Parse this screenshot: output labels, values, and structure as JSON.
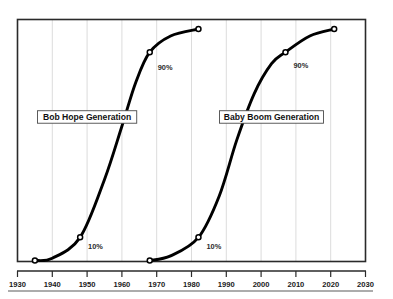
{
  "chart_data": {
    "type": "line",
    "title": "",
    "subtitle": "",
    "xlabel": "",
    "ylabel": "",
    "xlim": [
      1930,
      2030
    ],
    "ylim": [
      0,
      100
    ],
    "xticks": [
      1930,
      1940,
      1950,
      1960,
      1970,
      1980,
      1990,
      2000,
      2010,
      2020,
      2030
    ],
    "xtick_labels": [
      "1930",
      "1940",
      "1950",
      "1960",
      "1970",
      "1980",
      "1990",
      "2000",
      "2010",
      "2020",
      "2030"
    ],
    "yticks": [],
    "ytick_labels": [],
    "grid": "vertical",
    "legend": "inline-boxed-annotations",
    "series": [
      {
        "name": "Bob Hope Generation",
        "points": [
          {
            "x": 1935,
            "y": 0
          },
          {
            "x": 1940,
            "y": 1
          },
          {
            "x": 1948,
            "y": 10
          },
          {
            "x": 1955,
            "y": 35
          },
          {
            "x": 1960,
            "y": 58
          },
          {
            "x": 1964,
            "y": 77
          },
          {
            "x": 1968,
            "y": 90
          },
          {
            "x": 1974,
            "y": 97
          },
          {
            "x": 1982,
            "y": 100
          }
        ],
        "markers": [
          {
            "x": 1935,
            "y": 0,
            "label": ""
          },
          {
            "x": 1948,
            "y": 10,
            "label": "10%"
          },
          {
            "x": 1968,
            "y": 90,
            "label": "90%"
          },
          {
            "x": 1982,
            "y": 100,
            "label": ""
          }
        ]
      },
      {
        "name": "Baby Boom Generation",
        "points": [
          {
            "x": 1968,
            "y": 0
          },
          {
            "x": 1974,
            "y": 2
          },
          {
            "x": 1982,
            "y": 10
          },
          {
            "x": 1988,
            "y": 28
          },
          {
            "x": 1993,
            "y": 52
          },
          {
            "x": 1998,
            "y": 72
          },
          {
            "x": 2003,
            "y": 85
          },
          {
            "x": 2007,
            "y": 90
          },
          {
            "x": 2014,
            "y": 97
          },
          {
            "x": 2021,
            "y": 100
          }
        ],
        "markers": [
          {
            "x": 1968,
            "y": 0,
            "label": ""
          },
          {
            "x": 1982,
            "y": 10,
            "label": "10%"
          },
          {
            "x": 2007,
            "y": 90,
            "label": "90%"
          },
          {
            "x": 2021,
            "y": 100,
            "label": ""
          }
        ]
      }
    ],
    "annotations": [
      {
        "text": "Bob Hope Generation",
        "x": 1950,
        "y": 62,
        "boxed": true
      },
      {
        "text": "Baby Boom Generation",
        "x": 2003,
        "y": 62,
        "boxed": true
      },
      {
        "text": "10%",
        "x": 1950,
        "y": 6,
        "boxed": false
      },
      {
        "text": "90%",
        "x": 1970,
        "y": 83,
        "boxed": false
      },
      {
        "text": "10%",
        "x": 1984,
        "y": 6,
        "boxed": false
      },
      {
        "text": "90%",
        "x": 2009,
        "y": 84,
        "boxed": false
      }
    ],
    "colors": {
      "curve": "#000000",
      "marker_fill": "#ffffff",
      "marker_stroke": "#000000",
      "gridline": "#d8d8d8",
      "frame": "#2a2a2a",
      "text": "#1a1a1a",
      "background": "#ffffff"
    }
  },
  "axis": {
    "tick_labels": [
      "1930",
      "1940",
      "1950",
      "1960",
      "1970",
      "1980",
      "1990",
      "2000",
      "2010",
      "2020",
      "2030"
    ]
  },
  "annotations": {
    "bob_hope_label": "Bob Hope Generation",
    "baby_boom_label": "Baby Boom Generation",
    "bob_hope_10": "10%",
    "bob_hope_90": "90%",
    "baby_boom_10": "10%",
    "baby_boom_90": "90%"
  }
}
